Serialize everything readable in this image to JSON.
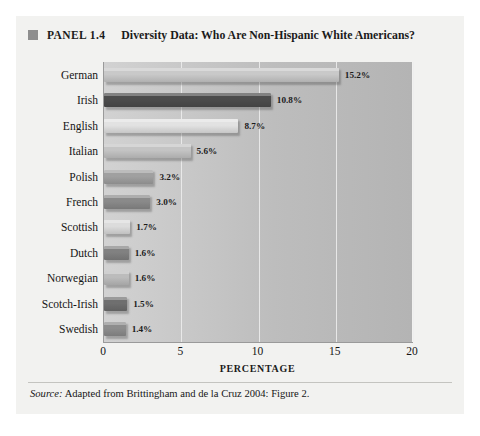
{
  "panel": {
    "marker_icon": "square-marker-icon",
    "label": "PANEL 1.4",
    "title": "Diversity Data: Who Are Non-Hispanic White Americans?"
  },
  "source": {
    "prefix": "Source:",
    "text": " Adapted from Brittingham and de la Cruz 2004: Figure 2."
  },
  "colors": {
    "panel_background": "#f2f2f0",
    "plot_background": "#c2c2c2",
    "gridline": "#eeeeee",
    "axis": "#9a9a9a",
    "text": "#1b1b1b",
    "marker": "#8e8e8e"
  },
  "chart_data": {
    "type": "bar",
    "orientation": "horizontal",
    "title": "Diversity Data: Who Are Non-Hispanic White Americans?",
    "xlabel": "PERCENTAGE",
    "ylabel": "",
    "xlim": [
      0,
      20
    ],
    "xticks": [
      0,
      5,
      10,
      15,
      20
    ],
    "xtick_labels": [
      "0",
      "5",
      "10",
      "15",
      "20"
    ],
    "grid": true,
    "legend": false,
    "categories": [
      "German",
      "Irish",
      "English",
      "Italian",
      "Polish",
      "French",
      "Scottish",
      "Dutch",
      "Norwegian",
      "Scotch-Irish",
      "Swedish"
    ],
    "values": [
      15.2,
      10.8,
      8.7,
      5.6,
      3.2,
      3.0,
      1.7,
      1.6,
      1.6,
      1.5,
      1.4
    ],
    "value_labels": [
      "15.2%",
      "10.8%",
      "8.7%",
      "5.6%",
      "3.2%",
      "3.0%",
      "1.7%",
      "1.6%",
      "1.6%",
      "1.5%",
      "1.4%"
    ],
    "bar_colors": [
      "#c9c9c9",
      "#4c4c4c",
      "#e2e2e2",
      "#c4c4c4",
      "#a0a0a0",
      "#8a8a8a",
      "#dcdcdc",
      "#818181",
      "#bcbcbc",
      "#6f6f6f",
      "#8d8d8d"
    ]
  }
}
